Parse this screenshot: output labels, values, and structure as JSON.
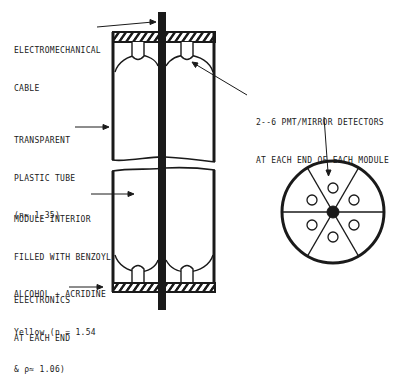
{
  "diagram": {
    "title": "",
    "labels": {
      "cable": [
        "Electromechanical",
        "Cable"
      ],
      "tube": [
        "Transparent",
        "Plastic Tube",
        "(n≈ 1.35)"
      ],
      "detectors": [
        "2--6 PMT/Mirror Detectors",
        "at Each End of Each Module"
      ],
      "interior": [
        "Module Interior",
        "Filled With Benzoyl",
        "Alcohol + Acridine",
        "Yellow (n = 1.54",
        "& ρ≈ 1.06)"
      ],
      "electronics": [
        "Electronics",
        "at Each End"
      ]
    },
    "cross_section": {
      "segments": 6,
      "detectors_per_end": 6,
      "center": "cable"
    },
    "colors": {
      "ink": "#1a1a1a",
      "background": "#ffffff"
    }
  }
}
